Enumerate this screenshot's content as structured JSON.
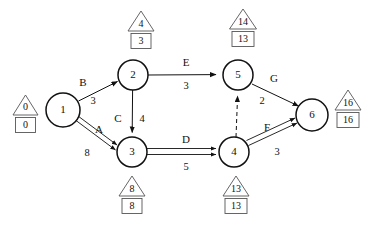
{
  "diagram": {
    "type": "activity-on-arrow-network",
    "title_caption": "",
    "nodes": [
      {
        "id": "1",
        "label": "1",
        "cx": 63,
        "cy": 110,
        "r": 17,
        "early": "0",
        "late": "0",
        "marker_pos": "left"
      },
      {
        "id": "2",
        "label": "2",
        "cx": 133,
        "cy": 75,
        "r": 15,
        "early": "4",
        "late": "3",
        "marker_pos": "top"
      },
      {
        "id": "3",
        "label": "3",
        "cx": 132,
        "cy": 152,
        "r": 15,
        "early": "8",
        "late": "8",
        "marker_pos": "bottom"
      },
      {
        "id": "4",
        "label": "4",
        "cx": 234,
        "cy": 152,
        "r": 15,
        "early": "13",
        "late": "13",
        "marker_pos": "bottom"
      },
      {
        "id": "5",
        "label": "5",
        "cx": 238,
        "cy": 75,
        "r": 15,
        "early": "14",
        "late": "13",
        "marker_pos": "top"
      },
      {
        "id": "6",
        "label": "6",
        "cx": 312,
        "cy": 115,
        "r": 16,
        "early": "16",
        "late": "16",
        "marker_pos": "right"
      }
    ],
    "activities": [
      {
        "name": "B",
        "from": "1",
        "to": "2",
        "duration": "3",
        "critical": false,
        "dummy": false
      },
      {
        "name": "A",
        "from": "1",
        "to": "3",
        "duration": "8",
        "critical": true,
        "dummy": false
      },
      {
        "name": "C",
        "from": "2",
        "to": "3",
        "duration": "4",
        "critical": false,
        "dummy": false
      },
      {
        "name": "E",
        "from": "2",
        "to": "5",
        "duration": "3",
        "critical": false,
        "dummy": false
      },
      {
        "name": "D",
        "from": "3",
        "to": "4",
        "duration": "5",
        "critical": true,
        "dummy": false
      },
      {
        "name": "",
        "from": "4",
        "to": "5",
        "duration": "",
        "critical": false,
        "dummy": true
      },
      {
        "name": "F",
        "from": "4",
        "to": "6",
        "duration": "3",
        "critical": true,
        "dummy": false
      },
      {
        "name": "G",
        "from": "5",
        "to": "6",
        "duration": "2",
        "critical": false,
        "dummy": false
      }
    ],
    "legend": {
      "triangle_meaning": "latest-finish-time",
      "box_meaning": "earliest-finish-time"
    },
    "colors": {
      "line": "#111111",
      "marker_outline": "#555555",
      "background": "#ffffff"
    }
  },
  "labels": {
    "node_1": "1",
    "node_2": "2",
    "node_3": "3",
    "node_4": "4",
    "node_5": "5",
    "node_6": "6",
    "act_A": "A",
    "act_B": "B",
    "act_C": "C",
    "act_D": "D",
    "act_E": "E",
    "act_F": "F",
    "act_G": "G",
    "dur_A": "8",
    "dur_B": "3",
    "dur_C": "4",
    "dur_D": "5",
    "dur_E": "3",
    "dur_F": "3",
    "dur_G": "2",
    "tri_1": "0",
    "box_1": "0",
    "tri_2": "4",
    "box_2": "3",
    "tri_3": "8",
    "box_3": "8",
    "tri_4": "13",
    "box_4": "13",
    "tri_5": "14",
    "box_5": "13",
    "tri_6": "16",
    "box_6": "16"
  }
}
